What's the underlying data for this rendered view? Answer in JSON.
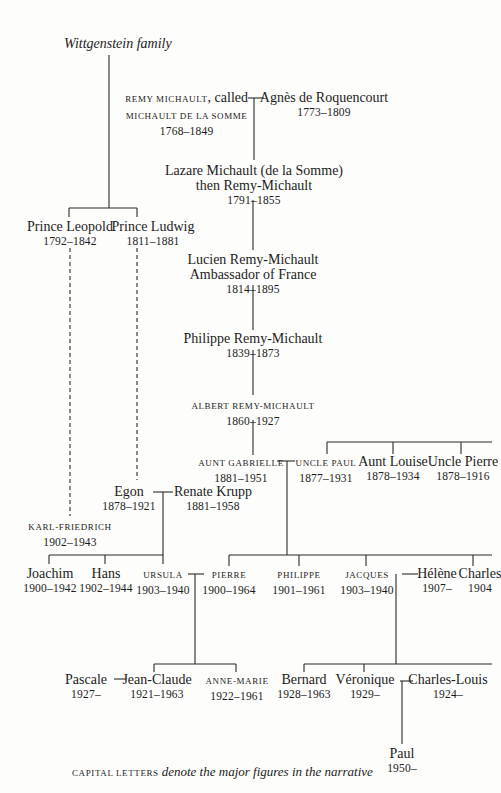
{
  "title": "Wittgenstein family",
  "caption": {
    "smallcaps": "CAPITAL LETTERS",
    "italic": "denote the major figures in the narrative"
  },
  "people": {
    "remy": {
      "line1_sc": "REMY MICHAULT",
      "line1_rest": ", called",
      "line2_sc": "MICHAULT DE LA SOMME",
      "dates": "1768–1849"
    },
    "agnes": {
      "name": "Agnès de Roquencourt",
      "dates": "1773–1809"
    },
    "lazare": {
      "name": "Lazare Michault (de la Somme)",
      "sub": "then Remy-Michault",
      "dates": "1791–1855"
    },
    "lucien": {
      "name": "Lucien Remy-Michault",
      "sub": "Ambassador of France",
      "dates": "1814–1895"
    },
    "philippe_sr": {
      "name": "Philippe Remy-Michault",
      "dates": "1839–1873"
    },
    "albert": {
      "name_sc": "ALBERT REMY-MICHAULT",
      "dates": "1860–1927"
    },
    "leopold": {
      "name": "Prince Leopold",
      "dates": "1792–1842"
    },
    "ludwig": {
      "name": "Prince Ludwig",
      "dates": "1811–1881"
    },
    "aunt_gabrielle": {
      "name_sc": "AUNT GABRIELLE",
      "dates": "1881–1951"
    },
    "uncle_paul": {
      "name_sc": "UNCLE PAUL",
      "dates": "1877–1931"
    },
    "aunt_louise": {
      "name": "Aunt Louise",
      "dates": "1878–1934"
    },
    "uncle_pierre": {
      "name": "Uncle Pierre",
      "dates": "1878–1916"
    },
    "egon": {
      "name": "Egon",
      "dates": "1878–1921"
    },
    "renate": {
      "name": "Renate Krupp",
      "dates": "1881–1958"
    },
    "karl": {
      "name_sc": "KARL-FRIEDRICH",
      "dates": "1902–1943"
    },
    "joachim": {
      "name": "Joachim",
      "dates": "1900–1942"
    },
    "hans": {
      "name": "Hans",
      "dates": "1902–1944"
    },
    "ursula": {
      "name_sc": "URSULA",
      "dates": "1903–1940"
    },
    "pierre": {
      "name_sc": "PIERRE",
      "dates": "1900–1964"
    },
    "philippe": {
      "name_sc": "PHILIPPE",
      "dates": "1901–1961"
    },
    "jacques": {
      "name_sc": "JACQUES",
      "dates": "1903–1940"
    },
    "helene": {
      "name": "Hélène",
      "dates": "1907–"
    },
    "charles": {
      "name": "Charles",
      "dates": "1904"
    },
    "pascale": {
      "name": "Pascale",
      "dates": "1927–"
    },
    "jean_claude": {
      "name": "Jean-Claude",
      "dates": "1921–1963"
    },
    "anne_marie": {
      "name_sc": "ANNE-MARIE",
      "dates": "1922–1961"
    },
    "bernard": {
      "name": "Bernard",
      "dates": "1928–1963"
    },
    "veronique": {
      "name": "Véronique",
      "dates": "1929–"
    },
    "charles_louis": {
      "name": "Charles-Louis",
      "dates": "1924–"
    },
    "paul": {
      "name": "Paul",
      "dates": "1950–"
    }
  },
  "colors": {
    "ink": "#1c1c1c",
    "paper": "#fdfdfb"
  }
}
